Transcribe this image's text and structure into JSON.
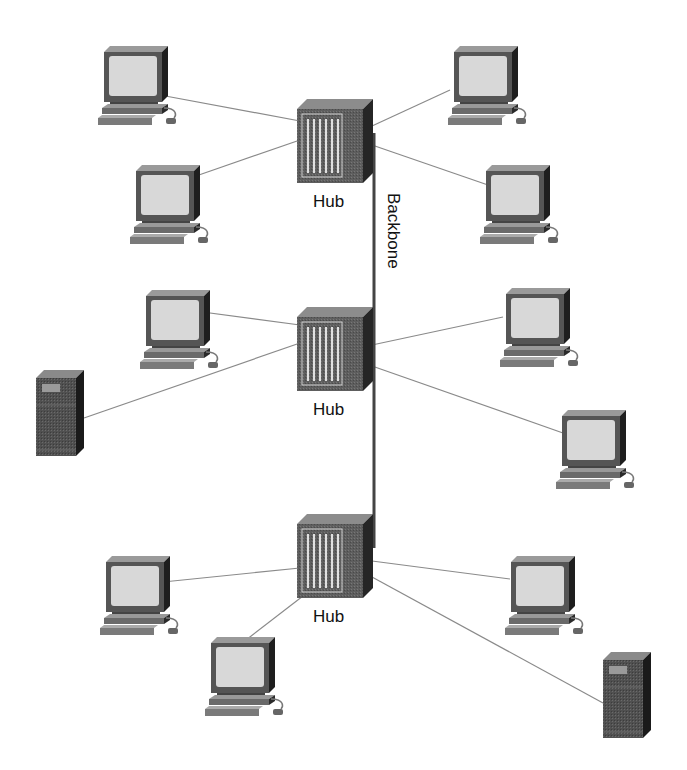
{
  "diagram": {
    "type": "network-topology",
    "backbone_label": "Backbone",
    "hub_label": "Hub",
    "colors": {
      "line": "#8a8a8a",
      "backbone": "#444444",
      "hub_body": "#5a5a5a",
      "hub_side": "#262626",
      "hub_top": "#8c8c8c",
      "monitor_screen": "#d6d6d6",
      "server_body": "#555555"
    },
    "hubs": [
      {
        "id": "hub-1",
        "label": "Hub",
        "x": 297,
        "y": 99
      },
      {
        "id": "hub-2",
        "label": "Hub",
        "x": 297,
        "y": 307
      },
      {
        "id": "hub-3",
        "label": "Hub",
        "x": 297,
        "y": 514
      }
    ],
    "nodes": [
      {
        "id": "pc-1",
        "kind": "computer",
        "hub": 0,
        "x": 98,
        "y": 46
      },
      {
        "id": "pc-2",
        "kind": "computer",
        "hub": 0,
        "x": 130,
        "y": 165
      },
      {
        "id": "pc-3",
        "kind": "computer",
        "hub": 0,
        "x": 448,
        "y": 46
      },
      {
        "id": "pc-4",
        "kind": "computer",
        "hub": 0,
        "x": 480,
        "y": 165
      },
      {
        "id": "pc-5",
        "kind": "computer",
        "hub": 1,
        "x": 140,
        "y": 290
      },
      {
        "id": "server-1",
        "kind": "server",
        "hub": 1,
        "x": 36,
        "y": 370
      },
      {
        "id": "pc-6",
        "kind": "computer",
        "hub": 1,
        "x": 500,
        "y": 288
      },
      {
        "id": "pc-7",
        "kind": "computer",
        "hub": 1,
        "x": 556,
        "y": 410
      },
      {
        "id": "pc-8",
        "kind": "computer",
        "hub": 2,
        "x": 100,
        "y": 556
      },
      {
        "id": "pc-9",
        "kind": "computer",
        "hub": 2,
        "x": 205,
        "y": 637
      },
      {
        "id": "pc-10",
        "kind": "computer",
        "hub": 2,
        "x": 505,
        "y": 556
      },
      {
        "id": "server-2",
        "kind": "server",
        "hub": 2,
        "x": 603,
        "y": 652
      }
    ],
    "links": [
      {
        "from": [
          300,
          121
        ],
        "to": [
          160,
          95
        ]
      },
      {
        "from": [
          300,
          140
        ],
        "to": [
          196,
          176
        ]
      },
      {
        "from": [
          372,
          126
        ],
        "to": [
          450,
          90
        ]
      },
      {
        "from": [
          372,
          145
        ],
        "to": [
          488,
          185
        ]
      },
      {
        "from": [
          300,
          325
        ],
        "to": [
          195,
          311
        ]
      },
      {
        "from": [
          300,
          343
        ],
        "to": [
          84,
          418
        ]
      },
      {
        "from": [
          372,
          345
        ],
        "to": [
          503,
          317
        ]
      },
      {
        "from": [
          372,
          366
        ],
        "to": [
          563,
          433
        ]
      },
      {
        "from": [
          300,
          568
        ],
        "to": [
          163,
          582
        ]
      },
      {
        "from": [
          316,
          586
        ],
        "to": [
          246,
          640
        ]
      },
      {
        "from": [
          372,
          561
        ],
        "to": [
          510,
          579
        ]
      },
      {
        "from": [
          372,
          577
        ],
        "to": [
          603,
          703
        ]
      }
    ],
    "backbone": {
      "x": 374,
      "y1": 133,
      "y2": 548
    }
  }
}
